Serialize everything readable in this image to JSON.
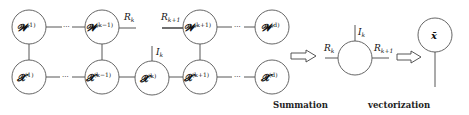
{
  "diagram": {
    "top_row": [
      {
        "id": "w1",
        "base": "𝓦",
        "sup": "(1)"
      },
      {
        "id": "wkm1",
        "base": "𝓦",
        "sup": "(k−1)"
      },
      {
        "id": "wkp1",
        "base": "𝓦",
        "sup": "(k+1)"
      },
      {
        "id": "wd",
        "base": "𝓦",
        "sup": "(d)"
      }
    ],
    "bottom_row": [
      {
        "id": "x1",
        "base": "𝓧",
        "sup": "(1)"
      },
      {
        "id": "xkm1",
        "base": "𝓧",
        "sup": "(k−1)"
      },
      {
        "id": "xk",
        "base": "𝓧",
        "sup": "(k)"
      },
      {
        "id": "xkp1",
        "base": "𝓧",
        "sup": "(k+1)"
      },
      {
        "id": "xd",
        "base": "𝓧",
        "sup": "(d)"
      }
    ],
    "ellipsis": "···",
    "edge_labels": {
      "rk": {
        "base": "R",
        "sub": "k"
      },
      "rk1": {
        "base": "R",
        "sub": "k+1"
      },
      "ik": {
        "base": "I",
        "sub": "k"
      }
    },
    "summation_node": {
      "left": {
        "base": "R",
        "sub": "k"
      },
      "right": {
        "base": "R",
        "sub": "k+1"
      },
      "top": {
        "base": "I",
        "sub": "k"
      }
    },
    "vector_node": {
      "label": "x̄"
    },
    "captions": {
      "summation": "Summation",
      "vectorization": "vectorization"
    }
  }
}
